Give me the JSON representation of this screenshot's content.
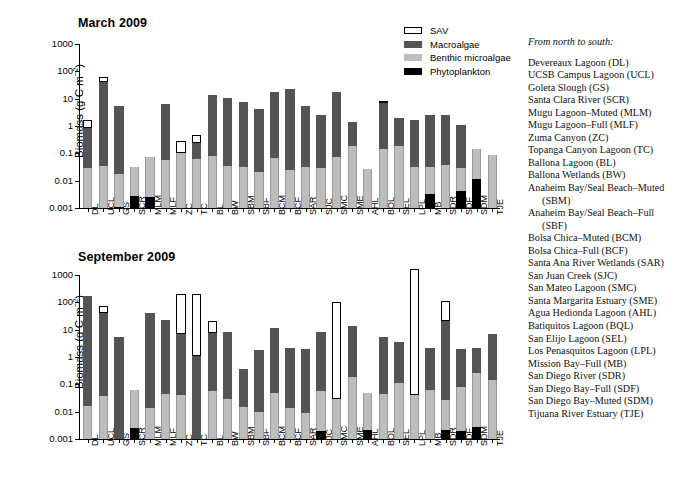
{
  "figure": {
    "legend": {
      "title": "",
      "entries": [
        {
          "key": "sav",
          "label": "SAV",
          "color": "#ffffff"
        },
        {
          "key": "macro",
          "label": "Macroalgae",
          "color": "#545454"
        },
        {
          "key": "bmi",
          "label": "Benthic microalgae",
          "color": "#bdbdbd"
        },
        {
          "key": "phyto",
          "label": "Phytoplankton",
          "color": "#000000"
        }
      ]
    },
    "sitelist": {
      "heading": "From north to south:",
      "items": [
        "Devereaux Lagoon (DL)",
        "UCSB Campus Lagoon (UCL)",
        "Goleta Slough (GS)",
        "Santa Clara River (SCR)",
        "Mugu Lagoon–Muted (MLM)",
        "Mugu Lagoon–Full (MLF)",
        "Zuma Canyon (ZC)",
        "Topanga Canyon Lagoon (TC)",
        "Ballona Lagoon (BL)",
        "Ballona Wetlands (BW)",
        "Anaheim Bay/Seal Beach–Muted",
        "(SBM)",
        "Anaheim Bay/Seal Beach–Full",
        "(SBF)",
        "Bolsa Chica–Muted (BCM)",
        "Bolsa Chica–Full (BCF)",
        "Santa Ana River Wetlands (SAR)",
        "San Juan Creek (SJC)",
        "San Mateo Lagoon (SMC)",
        "Santa Margarita Estuary (SME)",
        "Agua Hedionda Lagoon (AHL)",
        "Batiquitos Lagoon (BQL)",
        "San Elijo Lagoon (SEL)",
        "Los Penasquitos Lagoon (LPL)",
        "Mission Bay–Full (MB)",
        "San Diego River (SDR)",
        "San Diego Bay–Full (SDF)",
        "San Diego Bay–Muted (SDM)",
        "Tijuana River Estuary (TJE)"
      ],
      "continuation_indices": [
        11,
        13
      ]
    }
  },
  "chart_data": [
    {
      "type": "bar",
      "id": "march-2009",
      "title": "March 2009",
      "xlabel": "",
      "ylabel": "Biomass (g C m⁻²)",
      "yscale": "log",
      "ylim": [
        0.001,
        1000
      ],
      "yticks": [
        0.001,
        0.01,
        0.1,
        1,
        10,
        100,
        1000
      ],
      "ytick_labels": [
        "0.001",
        "0.01",
        "0.1",
        "1",
        "10",
        "100",
        "1000"
      ],
      "grid": false,
      "stacked": true,
      "categories": [
        "DL",
        "UCL",
        "GS",
        "SCR",
        "MLM",
        "MLF",
        "ZC",
        "TC",
        "BL",
        "BW",
        "SBM",
        "SBF",
        "BCM",
        "BCF",
        "SAR",
        "SJC",
        "SMC",
        "SME",
        "AHL",
        "BQL",
        "SEL",
        "LPL",
        "MB",
        "SDR",
        "SDF",
        "SDM",
        "TJE"
      ],
      "series": [
        {
          "name": "Phytoplankton",
          "color": "#000000",
          "values": [
            null,
            null,
            0.0011,
            0.0028,
            0.0026,
            null,
            null,
            null,
            null,
            null,
            null,
            null,
            null,
            null,
            null,
            0.0008,
            0.0008,
            null,
            null,
            null,
            null,
            null,
            0.0032,
            null,
            0.0042,
            0.0115,
            null
          ]
        },
        {
          "name": "Benthic microalgae",
          "color": "#bdbdbd",
          "values": [
            0.029,
            0.035,
            0.018,
            0.033,
            0.075,
            0.057,
            0.1,
            0.062,
            0.078,
            0.035,
            0.031,
            0.02,
            0.066,
            0.024,
            0.031,
            0.03,
            0.074,
            0.19,
            0.027,
            0.15,
            0.18,
            0.033,
            0.033,
            0.038,
            0.03,
            0.15,
            0.088
          ]
        },
        {
          "name": "Macroalgae",
          "color": "#545454",
          "values": [
            0.85,
            40.0,
            5.6,
            null,
            null,
            6.3,
            null,
            0.24,
            14.0,
            11.0,
            7.8,
            4.1,
            17.0,
            23.0,
            5.4,
            2.6,
            18.0,
            1.35,
            null,
            6.7,
            2.0,
            1.6,
            2.6,
            2.6,
            1.1,
            null,
            null
          ]
        },
        {
          "name": "SAV",
          "color": "#ffffff",
          "values": [
            1.6,
            60.0,
            null,
            null,
            null,
            null,
            0.28,
            0.47,
            null,
            null,
            null,
            null,
            null,
            null,
            null,
            null,
            null,
            null,
            null,
            7.3,
            null,
            null,
            null,
            null,
            null,
            null,
            null
          ]
        }
      ]
    },
    {
      "type": "bar",
      "id": "september-2009",
      "title": "September 2009",
      "xlabel": "",
      "ylabel": "Biomass (g C m⁻²)",
      "yscale": "log",
      "ylim": [
        0.001,
        1000
      ],
      "yticks": [
        0.001,
        0.01,
        0.1,
        1,
        10,
        100,
        1000
      ],
      "ytick_labels": [
        "0.001",
        "0.01",
        "0.1",
        "1",
        "10",
        "100",
        "1000"
      ],
      "grid": false,
      "stacked": true,
      "categories": [
        "DL",
        "UCL",
        "GS",
        "SCR",
        "MLM",
        "MLF",
        "ZC",
        "TC",
        "BL",
        "BW",
        "SBM",
        "SBF",
        "BCM",
        "BCF",
        "SAR",
        "SJC",
        "SMC",
        "SME",
        "AHL",
        "BQL",
        "SEL",
        "LPL",
        "MB",
        "SDR",
        "SDF",
        "SDM",
        "TJE"
      ],
      "series": [
        {
          "name": "Phytoplankton",
          "color": "#000000",
          "values": [
            null,
            0.0008,
            null,
            0.0026,
            null,
            null,
            null,
            null,
            null,
            null,
            null,
            null,
            null,
            null,
            null,
            0.0019,
            null,
            null,
            0.0021,
            null,
            null,
            null,
            null,
            0.0022,
            0.002,
            0.0028,
            null
          ]
        },
        {
          "name": "Benthic microalgae",
          "color": "#bdbdbd",
          "values": [
            0.016,
            0.037,
            null,
            0.06,
            0.014,
            0.045,
            0.042,
            null,
            0.057,
            0.03,
            0.015,
            0.0095,
            0.049,
            0.014,
            0.0088,
            0.058,
            0.03,
            0.19,
            0.047,
            0.045,
            0.11,
            0.041,
            0.062,
            0.026,
            0.077,
            0.25,
            0.14
          ]
        },
        {
          "name": "Macroalgae",
          "color": "#545454",
          "values": [
            170.0,
            40.0,
            5.5,
            null,
            42.0,
            22.0,
            6.9,
            1.05,
            7.3,
            8.0,
            0.36,
            1.8,
            12.0,
            2.15,
            2.0,
            8.4,
            null,
            14.0,
            null,
            5.4,
            3.5,
            null,
            2.1,
            20.0,
            2.0,
            2.1,
            7.0
          ]
        },
        {
          "name": "SAV",
          "color": "#ffffff",
          "values": [
            null,
            75.0,
            null,
            null,
            null,
            null,
            210.0,
            205.0,
            20.0,
            null,
            null,
            null,
            null,
            null,
            null,
            null,
            100.0,
            null,
            null,
            null,
            null,
            1700.0,
            null,
            110.0,
            null,
            null,
            null
          ]
        }
      ]
    }
  ]
}
